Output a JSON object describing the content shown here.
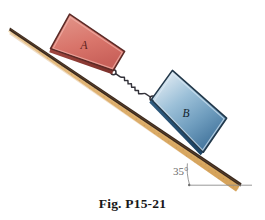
{
  "figure": {
    "caption": "Fig. P15-21",
    "background_color": "#ffffff",
    "incline": {
      "name": "inclined-surface",
      "angle_label": "35°",
      "angle_value": 35,
      "surface_color": "#e6b877",
      "surface_color_light": "#f5dcb0",
      "surface_color_dark": "#cf9b4f",
      "edge_color": "#4a3526",
      "speckle_color": "#b07b34"
    },
    "horizontal_reference": {
      "name": "horizontal-reference-line",
      "color": "#8d8d8d"
    },
    "angle_arc": {
      "name": "angle-arc",
      "color": "#8d8d8d"
    },
    "blocks": [
      {
        "id": "block-a",
        "label": "A",
        "fill": "#d9756b",
        "fill_light": "#e5938a",
        "fill_dark": "#b9544c",
        "edge": "#5b2a26",
        "label_color": "#5a1d18"
      },
      {
        "id": "block-b",
        "label": "B",
        "fill": "#7fa8c6",
        "fill_light": "#dce9f2",
        "fill_dark": "#3f7099",
        "edge": "#22384a",
        "label_color": "#13222e"
      }
    ],
    "spring": {
      "name": "spring-connector",
      "color": "#33323a",
      "coils": 11
    }
  }
}
